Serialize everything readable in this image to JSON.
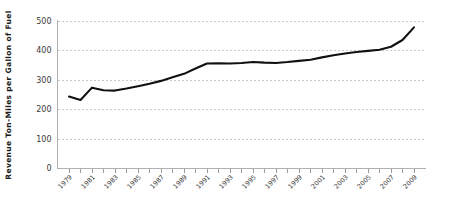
{
  "chart_data": {
    "type": "line",
    "title": "",
    "xlabel": "",
    "ylabel": "Revenue Ton-Miles per Gallon of Fuel",
    "ylim": [
      0,
      500
    ],
    "xlim": [
      1978,
      2010
    ],
    "grid": true,
    "legend": "none",
    "y_ticks": [
      0,
      100,
      200,
      300,
      400,
      500
    ],
    "y_tick_labels": [
      "0",
      "100",
      "200",
      "300",
      "400",
      "500"
    ],
    "x_tick_labels": [
      "1979",
      "1981",
      "1983",
      "1985",
      "1987",
      "1989",
      "1991",
      "1993",
      "1995",
      "1997",
      "1999",
      "2001",
      "2003",
      "2005",
      "2007",
      "2009"
    ],
    "x": [
      1979,
      1980,
      1981,
      1982,
      1983,
      1984,
      1985,
      1986,
      1987,
      1988,
      1989,
      1990,
      1991,
      1992,
      1993,
      1994,
      1995,
      1996,
      1997,
      1998,
      1999,
      2000,
      2001,
      2002,
      2003,
      2004,
      2005,
      2006,
      2007,
      2008,
      2009
    ],
    "values": [
      245,
      233,
      275,
      266,
      265,
      272,
      280,
      288,
      298,
      310,
      322,
      340,
      357,
      358,
      357,
      359,
      362,
      360,
      359,
      362,
      366,
      370,
      378,
      385,
      391,
      396,
      400,
      404,
      414,
      437,
      480
    ],
    "series_color": "#111111",
    "grid_color": "#c8c8c8",
    "axis_color": "#b0b0b0"
  }
}
